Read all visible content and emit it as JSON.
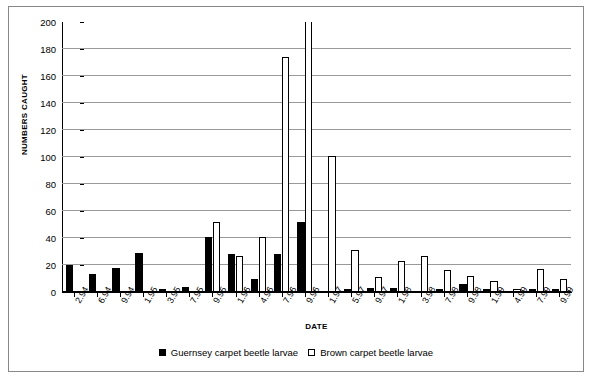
{
  "chart_data": {
    "type": "bar",
    "title": "",
    "xlabel": "DATE",
    "ylabel": "NUMBERS CAUGHT",
    "ylim": [
      0,
      200
    ],
    "ytick_step": 20,
    "yticks": [
      0,
      20,
      40,
      60,
      80,
      100,
      120,
      140,
      160,
      180,
      200
    ],
    "grid": true,
    "legend_position": "bottom-center",
    "clipped_note": "value exceeds y-axis maximum of 200 and is drawn clipped at the plot top",
    "categories": [
      "2.94",
      "6.94",
      "9.94",
      "1.95",
      "3.95",
      "7.95",
      "9.95",
      "1.96",
      "4.96",
      "7.96",
      "9.96",
      "1.97",
      "5.97",
      "9.97",
      "1.98",
      "3.98",
      "7.98",
      "9.98",
      "1.99",
      "4.99",
      "7.99",
      "9.99"
    ],
    "series": [
      {
        "name": "Guernsey carpet beetle larvae",
        "color": "#000000",
        "style": "filled",
        "values": [
          20,
          13,
          18,
          29,
          2,
          4,
          41,
          28,
          10,
          28,
          52,
          0,
          2,
          3,
          3,
          0,
          2,
          6,
          2,
          1,
          2,
          2
        ]
      },
      {
        "name": "Brown carpet beetle larvae",
        "color": "#ffffff",
        "style": "hollow",
        "values": [
          0,
          0,
          0,
          0,
          0,
          0,
          52,
          27,
          41,
          174,
          215,
          101,
          31,
          11,
          23,
          27,
          16,
          12,
          8,
          2,
          17,
          10
        ]
      }
    ]
  },
  "axis": {
    "y_title": "NUMBERS CAUGHT",
    "x_title": "DATE"
  },
  "legend": {
    "items": [
      {
        "label": "Guernsey carpet beetle larvae",
        "marker": "filled-square-icon"
      },
      {
        "label": "Brown carpet beetle larvae",
        "marker": "hollow-square-icon"
      }
    ]
  }
}
